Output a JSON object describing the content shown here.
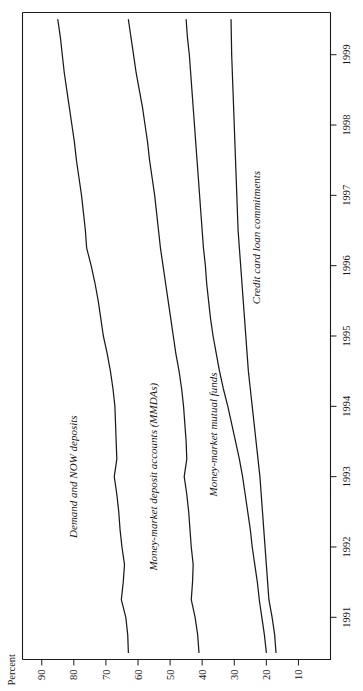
{
  "figure": {
    "ylabel": "Percent",
    "orientation_note": "rotated"
  },
  "chart_data": {
    "type": "line",
    "title": "",
    "subtitle": "",
    "xlabel": "",
    "ylabel": "Percent",
    "xlim": [
      1990.4,
      1999.6
    ],
    "ylim": [
      0,
      96
    ],
    "yticks": [
      10,
      20,
      30,
      40,
      50,
      60,
      70,
      80,
      90
    ],
    "ytick_labels": [
      "10",
      "20",
      "30",
      "40",
      "50",
      "60",
      "70",
      "80",
      "90"
    ],
    "xticks": [
      1991,
      1992,
      1993,
      1994,
      1995,
      1996,
      1997,
      1998,
      1999
    ],
    "xtick_labels": [
      "1991",
      "1992",
      "1993",
      "1994",
      "1995",
      "1996",
      "1997",
      "1998",
      "1999"
    ],
    "grid": false,
    "legend_position": "inline-labels",
    "x": [
      1990.5,
      1990.75,
      1991.0,
      1991.25,
      1991.5,
      1991.75,
      1992.0,
      1992.25,
      1992.5,
      1992.75,
      1993.0,
      1993.25,
      1993.5,
      1993.75,
      1994.0,
      1994.25,
      1994.5,
      1994.75,
      1995.0,
      1995.25,
      1995.5,
      1995.75,
      1996.0,
      1996.25,
      1996.5,
      1996.75,
      1997.0,
      1997.25,
      1997.5,
      1997.75,
      1998.0,
      1998.25,
      1998.5,
      1998.75,
      1999.0,
      1999.25,
      1999.5
    ],
    "series": [
      {
        "name": "Demand and NOW deposits",
        "label": "Demand and NOW deposits",
        "label_x": 1993.0,
        "label_y": 79.0,
        "values": [
          63.0,
          63.2,
          63.8,
          65.2,
          64.6,
          64.2,
          65.0,
          65.6,
          66.0,
          66.6,
          67.4,
          66.6,
          66.8,
          67.0,
          67.2,
          67.8,
          68.6,
          69.6,
          70.8,
          71.6,
          72.4,
          73.4,
          74.6,
          76.0,
          76.4,
          77.0,
          77.6,
          78.4,
          79.2,
          79.8,
          80.6,
          81.4,
          82.2,
          83.0,
          83.6,
          84.2,
          85.0
        ]
      },
      {
        "name": "Money-market deposit accounts (MMDAs)",
        "label": "Money-market deposit accounts (MMDAs)",
        "label_x": 1993.0,
        "label_y": 54.0,
        "values": [
          41.0,
          41.4,
          42.2,
          43.4,
          43.0,
          42.8,
          43.4,
          43.8,
          44.2,
          44.8,
          45.6,
          44.8,
          45.0,
          45.4,
          45.8,
          46.4,
          47.2,
          48.2,
          49.0,
          49.8,
          50.6,
          51.4,
          52.2,
          53.0,
          53.6,
          54.2,
          54.8,
          55.6,
          56.4,
          57.0,
          57.8,
          58.6,
          59.6,
          60.6,
          61.4,
          62.2,
          63.0
        ]
      },
      {
        "name": "Money-market mutual funds",
        "label": "Money-market mutual funds",
        "label_x": 1993.6,
        "label_y": 35.5,
        "values": [
          20.0,
          20.6,
          21.4,
          22.2,
          22.8,
          23.6,
          24.4,
          25.0,
          25.8,
          26.6,
          27.4,
          28.4,
          29.6,
          30.8,
          32.0,
          33.4,
          34.6,
          35.6,
          36.6,
          37.4,
          38.0,
          38.6,
          39.0,
          39.6,
          40.0,
          40.4,
          40.8,
          41.2,
          41.6,
          42.0,
          42.4,
          42.8,
          43.2,
          43.6,
          44.0,
          44.6,
          45.0
        ]
      },
      {
        "name": "Credit card loan commitments",
        "label": "Credit card loan commitments",
        "label_x": 1996.4,
        "label_y": 22.0,
        "values": [
          17.0,
          17.4,
          18.2,
          19.2,
          19.6,
          20.0,
          20.4,
          20.8,
          21.2,
          21.6,
          22.0,
          22.6,
          23.2,
          23.8,
          24.4,
          25.0,
          25.6,
          26.0,
          26.4,
          26.8,
          27.2,
          27.6,
          28.0,
          28.4,
          28.8,
          29.0,
          29.2,
          29.4,
          29.6,
          29.8,
          30.0,
          30.2,
          30.4,
          30.6,
          30.8,
          30.9,
          31.0
        ]
      }
    ]
  }
}
